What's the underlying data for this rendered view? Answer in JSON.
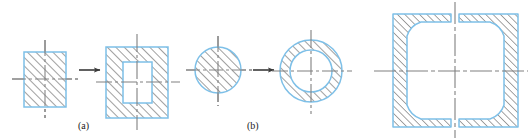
{
  "figure": {
    "captions": [
      {
        "id": "a",
        "label": "(a)",
        "x": 78,
        "y": 120
      },
      {
        "id": "b",
        "label": "(b)",
        "x": 247,
        "y": 120
      }
    ],
    "colors": {
      "outline": "#7ec0e8",
      "hatch": "#5a5a5a",
      "centerline": "#808080",
      "arrow": "#3a3a3a",
      "fill": "#ffffff",
      "background": "#ffffff"
    },
    "panels": [
      {
        "id": "panel-a",
        "caption": "(a)",
        "before": {
          "name": "solid-rectangle-section",
          "shape": "rectangle",
          "hatched": true,
          "hollow": false,
          "x": 24,
          "y": 52,
          "width": 42,
          "height": 55
        },
        "arrow": {
          "name": "transform-arrow-a",
          "x1": 76,
          "y1": 70,
          "x2": 100,
          "y2": 70,
          "direction": "right"
        },
        "after": {
          "name": "hollow-rectangle-section",
          "shape": "rectangle",
          "hatched": true,
          "hollow": true,
          "x": 106,
          "y": 47,
          "width": 62,
          "height": 71,
          "inner_x": 123,
          "inner_y": 62,
          "inner_width": 29,
          "inner_height": 41
        }
      },
      {
        "id": "panel-b",
        "caption": "(b)",
        "before": {
          "name": "solid-circle-section",
          "shape": "circle",
          "hatched": true,
          "hollow": false,
          "cx": 218,
          "cy": 70,
          "r": 23
        },
        "arrow": {
          "name": "transform-arrow-b",
          "x1": 250,
          "y1": 70,
          "x2": 274,
          "y2": 70,
          "direction": "right"
        },
        "after": {
          "name": "annulus-section",
          "shape": "annulus",
          "hatched": true,
          "hollow": true,
          "cx": 311,
          "cy": 71,
          "r_outer": 31,
          "r_inner": 21
        }
      },
      {
        "id": "panel-c",
        "caption": "",
        "detail": {
          "name": "box-section-detail",
          "shape": "box-section-split",
          "hatched": true,
          "hollow": true,
          "x": 393,
          "y": 14,
          "width": 125,
          "height": 113,
          "wall": 14,
          "fillet_radius": 22,
          "split_gap": 8
        }
      }
    ],
    "centerlines": [
      {
        "name": "centerline-h-rect-solid",
        "orientation": "horizontal",
        "x1": 12,
        "y1": 79,
        "x2": 78,
        "y2": 79
      },
      {
        "name": "centerline-v-rect-solid",
        "orientation": "vertical",
        "x1": 45,
        "y1": 40,
        "x2": 45,
        "y2": 118
      },
      {
        "name": "centerline-h-rect-hollow",
        "orientation": "horizontal",
        "x1": 96,
        "y1": 82,
        "x2": 180,
        "y2": 82
      },
      {
        "name": "centerline-v-rect-hollow",
        "orientation": "vertical",
        "x1": 137,
        "y1": 34,
        "x2": 137,
        "y2": 130
      },
      {
        "name": "centerline-h-circle-solid",
        "orientation": "horizontal",
        "x1": 186,
        "y1": 70,
        "x2": 252,
        "y2": 70
      },
      {
        "name": "centerline-v-circle-solid",
        "orientation": "vertical",
        "x1": 218,
        "y1": 36,
        "x2": 218,
        "y2": 106
      },
      {
        "name": "centerline-h-annulus",
        "orientation": "horizontal",
        "x1": 272,
        "y1": 71,
        "x2": 352,
        "y2": 71
      },
      {
        "name": "centerline-v-annulus",
        "orientation": "vertical",
        "x1": 311,
        "y1": 30,
        "x2": 311,
        "y2": 114
      },
      {
        "name": "centerline-h-box",
        "orientation": "horizontal",
        "x1": 374,
        "y1": 71,
        "x2": 528,
        "y2": 71
      },
      {
        "name": "centerline-v-box",
        "orientation": "vertical",
        "x1": 455,
        "y1": 2,
        "x2": 455,
        "y2": 138
      }
    ]
  }
}
